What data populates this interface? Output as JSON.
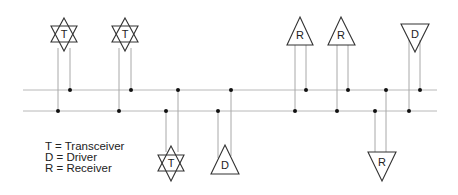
{
  "diagram": {
    "bus_lines": [
      {
        "name": "line-a",
        "y": 90,
        "x1": 23,
        "x2": 437
      },
      {
        "name": "line-b",
        "y": 111,
        "x1": 23,
        "x2": 437
      }
    ],
    "nodes": [
      {
        "type": "T",
        "kind": "transceiver",
        "position": "top",
        "cx": 64,
        "cy": 34,
        "left_leg_x": 58,
        "right_leg_x": 70
      },
      {
        "type": "T",
        "kind": "transceiver",
        "position": "top",
        "cx": 125,
        "cy": 34,
        "left_leg_x": 119,
        "right_leg_x": 131
      },
      {
        "type": "T",
        "kind": "transceiver",
        "position": "bottom",
        "cx": 171,
        "cy": 163,
        "left_leg_x": 166,
        "right_leg_x": 178
      },
      {
        "type": "D",
        "kind": "driver",
        "position": "bottom",
        "cx": 225,
        "cy": 162,
        "left_leg_x": 218,
        "right_leg_x": 231
      },
      {
        "type": "R",
        "kind": "receiver",
        "position": "top",
        "cx": 300,
        "cy": 33,
        "left_leg_x": 295,
        "right_leg_x": 306
      },
      {
        "type": "R",
        "kind": "receiver",
        "position": "top",
        "cx": 341,
        "cy": 33,
        "left_leg_x": 337,
        "right_leg_x": 348
      },
      {
        "type": "R",
        "kind": "receiver",
        "position": "bottom",
        "cx": 382,
        "cy": 163,
        "left_leg_x": 375,
        "right_leg_x": 386
      },
      {
        "type": "D",
        "kind": "driver",
        "position": "top",
        "cx": 415,
        "cy": 35,
        "left_leg_x": 409,
        "right_leg_x": 420
      }
    ],
    "labels": {
      "n0": "T",
      "n1": "T",
      "n2": "T",
      "n3": "D",
      "n4": "R",
      "n5": "R",
      "n6": "R",
      "n7": "D"
    }
  },
  "legend": {
    "items": [
      {
        "symbol": "T",
        "text": "T = Transceiver"
      },
      {
        "symbol": "D",
        "text": "D = Driver"
      },
      {
        "symbol": "R",
        "text": "R = Receiver"
      }
    ]
  },
  "colors": {
    "bus": "#b8b8b8",
    "stub": "#a8a8a8",
    "outline": "#333333",
    "dot": "#111111",
    "text": "#222222"
  }
}
